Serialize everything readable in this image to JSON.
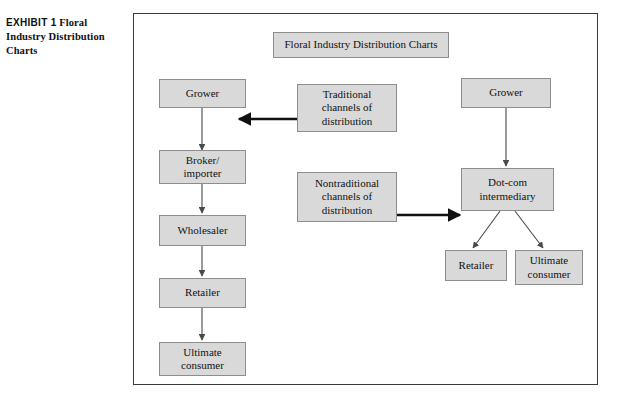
{
  "caption": {
    "exhibit_label": "EXHIBIT 1",
    "text": " Floral Industry Distribution Charts"
  },
  "diagram": {
    "title": "Floral Industry Distribution Charts",
    "traditional_chain": {
      "grower": "Grower",
      "broker_importer": "Broker/\nimporter",
      "wholesaler": "Wholesaler",
      "retailer": "Retailer",
      "ultimate_consumer": "Ultimate\nconsumer"
    },
    "labels": {
      "traditional": "Traditional\nchannels of\ndistribution",
      "nontraditional": "Nontraditional\nchannels of\ndistribution"
    },
    "nontraditional_chain": {
      "grower": "Grower",
      "dotcom_intermediary": "Dot-com\nintermediary",
      "retailer": "Retailer",
      "ultimate_consumer": "Ultimate\nconsumer"
    }
  },
  "colors": {
    "box_fill": "#d9d9d9",
    "box_border": "#8d8d8d",
    "frame_border": "#3a3a3a",
    "arrow": "#4a4a4a",
    "bold_arrow": "#111111",
    "text": "#121212",
    "page_background": "#ffffff"
  }
}
